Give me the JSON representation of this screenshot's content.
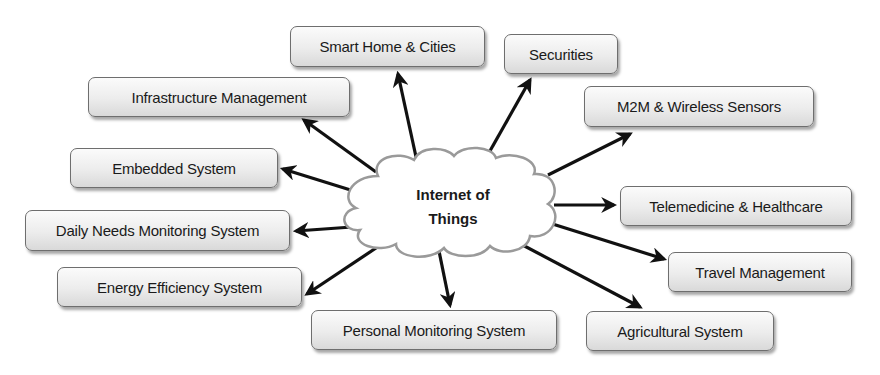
{
  "center": {
    "line1": "Internet of",
    "line2": "Things"
  },
  "nodes": [
    {
      "id": "smart-home-cities",
      "label": "Smart Home & Cities"
    },
    {
      "id": "securities",
      "label": "Securities"
    },
    {
      "id": "infrastructure-management",
      "label": "Infrastructure Management"
    },
    {
      "id": "m2m-wireless-sensors",
      "label": "M2M & Wireless Sensors"
    },
    {
      "id": "embedded-system",
      "label": "Embedded System"
    },
    {
      "id": "telemedicine-healthcare",
      "label": "Telemedicine & Healthcare"
    },
    {
      "id": "daily-needs-monitoring",
      "label": "Daily Needs Monitoring System"
    },
    {
      "id": "travel-management",
      "label": "Travel Management"
    },
    {
      "id": "energy-efficiency",
      "label": "Energy Efficiency System"
    },
    {
      "id": "personal-monitoring",
      "label": "Personal Monitoring System"
    },
    {
      "id": "agricultural-system",
      "label": "Agricultural System"
    }
  ],
  "colors": {
    "arrow": "#111111",
    "cloud_stroke": "#9a9a9a",
    "box_border": "#6e6e6e"
  }
}
